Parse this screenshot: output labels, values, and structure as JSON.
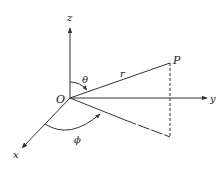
{
  "diagram": {
    "colors": {
      "line": "#333333",
      "text": "#222222",
      "background": "#ffffff"
    },
    "labels": {
      "z_axis": "z",
      "y_axis": "y",
      "x_axis": "x",
      "origin": "O",
      "point": "P",
      "radius": "r",
      "theta": "θ",
      "phi": "ϕ"
    },
    "elements": [
      {
        "id": "z-axis",
        "type": "axis",
        "from": [
          70,
          98
        ],
        "to": [
          70,
          28
        ],
        "arrow": true
      },
      {
        "id": "y-axis",
        "type": "axis",
        "from": [
          70,
          98
        ],
        "to": [
          207,
          98
        ],
        "arrow": true
      },
      {
        "id": "x-axis",
        "type": "axis",
        "from": [
          70,
          98
        ],
        "to": [
          22,
          148
        ],
        "arrow": true
      },
      {
        "id": "radius-line",
        "type": "line",
        "from": [
          70,
          98
        ],
        "to": [
          170,
          63
        ]
      },
      {
        "id": "projection-line",
        "type": "line",
        "from": [
          70,
          98
        ],
        "to": [
          170,
          137
        ],
        "dashed_from_fraction": 0.55
      },
      {
        "id": "drop-line",
        "type": "dashed",
        "from": [
          170,
          63
        ],
        "to": [
          170,
          137
        ]
      },
      {
        "id": "theta-arc",
        "type": "arc",
        "between": [
          "z-axis",
          "radius-line"
        ]
      },
      {
        "id": "phi-arc",
        "type": "arc",
        "between": [
          "x-axis",
          "projection-line"
        ]
      }
    ]
  }
}
